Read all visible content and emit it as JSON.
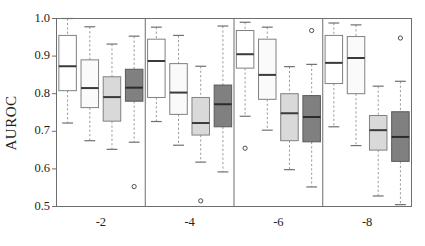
{
  "chart_data": {
    "type": "box",
    "title": "",
    "xlabel": "",
    "ylabel": "AUROC",
    "ylim": [
      0.5,
      1.0
    ],
    "yticks": [
      0.5,
      0.6,
      0.7,
      0.8,
      0.9,
      1.0
    ],
    "ytick_labels": [
      "0.5",
      "0.6",
      "0.7",
      "0.8",
      "0.9",
      "1.0"
    ],
    "grid": false,
    "legend": "none",
    "panels": [
      {
        "label": "-2",
        "boxes": [
          {
            "fill": "#ffffff",
            "whisker_low": 0.722,
            "q1": 0.808,
            "median": 0.873,
            "q3": 0.955,
            "whisker_high": 1.0,
            "outliers": []
          },
          {
            "fill": "#fafafa",
            "whisker_low": 0.675,
            "q1": 0.763,
            "median": 0.815,
            "q3": 0.89,
            "whisker_high": 0.978,
            "outliers": []
          },
          {
            "fill": "#d9d9d9",
            "whisker_low": 0.652,
            "q1": 0.727,
            "median": 0.791,
            "q3": 0.845,
            "whisker_high": 0.932,
            "outliers": []
          },
          {
            "fill": "#808080",
            "whisker_low": 0.671,
            "q1": 0.78,
            "median": 0.816,
            "q3": 0.865,
            "whisker_high": 0.953,
            "outliers": [
              0.553
            ]
          }
        ]
      },
      {
        "label": "-4",
        "boxes": [
          {
            "fill": "#ffffff",
            "whisker_low": 0.726,
            "q1": 0.79,
            "median": 0.887,
            "q3": 0.945,
            "whisker_high": 0.977,
            "outliers": []
          },
          {
            "fill": "#fafafa",
            "whisker_low": 0.663,
            "q1": 0.745,
            "median": 0.803,
            "q3": 0.88,
            "whisker_high": 0.955,
            "outliers": []
          },
          {
            "fill": "#d9d9d9",
            "whisker_low": 0.618,
            "q1": 0.69,
            "median": 0.722,
            "q3": 0.79,
            "whisker_high": 0.873,
            "outliers": [
              0.515
            ]
          },
          {
            "fill": "#808080",
            "whisker_low": 0.592,
            "q1": 0.712,
            "median": 0.772,
            "q3": 0.823,
            "whisker_high": 0.98,
            "outliers": []
          }
        ]
      },
      {
        "label": "-6",
        "boxes": [
          {
            "fill": "#ffffff",
            "whisker_low": 0.74,
            "q1": 0.868,
            "median": 0.905,
            "q3": 0.968,
            "whisker_high": 0.99,
            "outliers": [
              0.655
            ]
          },
          {
            "fill": "#fafafa",
            "whisker_low": 0.703,
            "q1": 0.785,
            "median": 0.85,
            "q3": 0.945,
            "whisker_high": 0.977,
            "outliers": []
          },
          {
            "fill": "#d9d9d9",
            "whisker_low": 0.598,
            "q1": 0.675,
            "median": 0.748,
            "q3": 0.8,
            "whisker_high": 0.872,
            "outliers": []
          },
          {
            "fill": "#808080",
            "whisker_low": 0.552,
            "q1": 0.672,
            "median": 0.738,
            "q3": 0.795,
            "whisker_high": 0.878,
            "outliers": [
              0.968
            ]
          }
        ]
      },
      {
        "label": "-8",
        "boxes": [
          {
            "fill": "#ffffff",
            "whisker_low": 0.712,
            "q1": 0.827,
            "median": 0.882,
            "q3": 0.955,
            "whisker_high": 0.988,
            "outliers": []
          },
          {
            "fill": "#fafafa",
            "whisker_low": 0.662,
            "q1": 0.8,
            "median": 0.895,
            "q3": 0.952,
            "whisker_high": 0.983,
            "outliers": []
          },
          {
            "fill": "#d9d9d9",
            "whisker_low": 0.528,
            "q1": 0.65,
            "median": 0.703,
            "q3": 0.742,
            "whisker_high": 0.82,
            "outliers": []
          },
          {
            "fill": "#808080",
            "whisker_low": 0.505,
            "q1": 0.62,
            "median": 0.685,
            "q3": 0.752,
            "whisker_high": 0.833,
            "outliers": [
              0.948
            ]
          }
        ]
      }
    ]
  },
  "axes": {
    "y_axis_title": "AUROC",
    "y_tick_labels": [
      "1.0",
      "0.9",
      "0.8",
      "0.7",
      "0.6",
      "0.5"
    ],
    "x_tick_labels": [
      "-2",
      "-4",
      "-6",
      "-8"
    ]
  }
}
